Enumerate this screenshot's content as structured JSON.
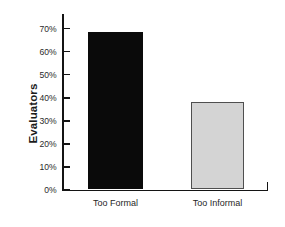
{
  "chart_data": {
    "type": "bar",
    "title": "",
    "subtitle": "",
    "xlabel": "",
    "ylabel": "Evaluators",
    "categories": [
      "Too Formal",
      "Too Informal"
    ],
    "values": [
      68,
      38
    ],
    "value_unit": "%",
    "ylim": [
      0,
      70
    ],
    "ytick_values": [
      0,
      10,
      20,
      30,
      40,
      50,
      60,
      70
    ],
    "ytick_labels": [
      "0%",
      "10%",
      "20%",
      "30%",
      "40%",
      "50%",
      "60%",
      "70%"
    ],
    "grid": false,
    "legend": false,
    "legend_position": "none",
    "bar_colors": [
      "#0a0a0a",
      "#d4d4d4"
    ],
    "bar_border_colors": [
      "#0a0a0a",
      "#4f4f4f"
    ],
    "axis_color": "#141414",
    "background_color": "#ffffff",
    "annotations": []
  }
}
